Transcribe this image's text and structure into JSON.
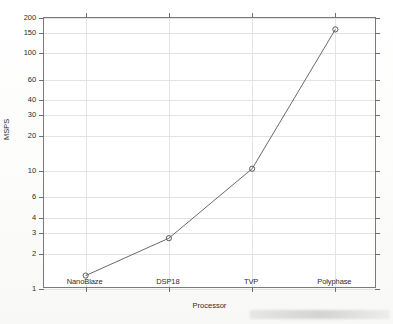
{
  "chart_data": {
    "type": "line",
    "title": "",
    "xlabel": "Processor",
    "ylabel": "MSPS",
    "categories": [
      "NanoBlaze",
      "DSP18",
      "TVP",
      "Polyphase"
    ],
    "values": [
      1.3,
      2.7,
      10.5,
      160
    ],
    "series": [
      {
        "name": "MSPS",
        "values": [
          1.3,
          2.7,
          10.5,
          160
        ]
      }
    ],
    "yscale": "log",
    "ylim": [
      1,
      200
    ],
    "yticks": [
      1,
      2,
      3,
      4,
      6,
      10,
      20,
      30,
      40,
      60,
      100,
      150,
      200
    ],
    "ytick_labels": [
      "1",
      "2",
      "3",
      "4",
      "6",
      "10",
      "20",
      "30",
      "40",
      "60",
      "100",
      "150",
      "200"
    ],
    "xticks": [
      1,
      2,
      3,
      4
    ],
    "xtick_labels": [
      "NanoBlaze",
      "DSP18",
      "TVP",
      "Polyphase"
    ],
    "grid": true,
    "legend": null,
    "marker": "open-circle",
    "line_color": "#6a6a6a",
    "grid_color": "#e2e2e2",
    "axis_color": "#7a7a7a"
  }
}
